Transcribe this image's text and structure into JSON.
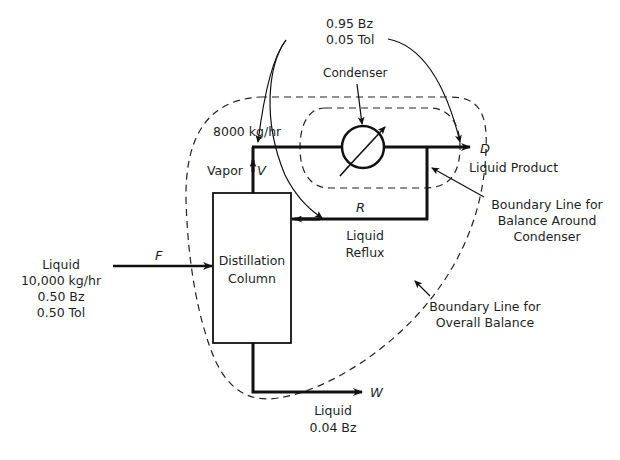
{
  "diagram": {
    "type": "process-flow",
    "distillate_composition": {
      "line1": "0.95 Bz",
      "line2": "0.05 Tol"
    },
    "condenser_label": "Condenser",
    "vapor_flow": "8000 kg/hr",
    "vapor_label": "Vapor",
    "vapor_symbol": "V",
    "distillate_symbol": "D",
    "distillate_label": "Liquid Product",
    "reflux_symbol": "R",
    "reflux_label": {
      "line1": "Liquid",
      "line2": "Reflux"
    },
    "column_label": {
      "line1": "Distillation",
      "line2": "Column"
    },
    "feed_symbol": "F",
    "feed": {
      "line1": "Liquid",
      "line2": "10,000 kg/hr",
      "line3": "0.50 Bz",
      "line4": "0.50 Tol"
    },
    "bottoms_symbol": "W",
    "bottoms": {
      "line1": "Liquid",
      "line2": "0.04 Bz"
    },
    "boundary_condenser": {
      "line1": "Boundary Line for",
      "line2": "Balance Around",
      "line3": "Condenser"
    },
    "boundary_overall": {
      "line1": "Boundary Line for",
      "line2": "Overall Balance"
    },
    "colors": {
      "line": "#111111",
      "background": "#ffffff"
    }
  }
}
